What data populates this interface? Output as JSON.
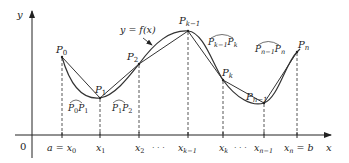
{
  "diagram": {
    "axes": {
      "x_label": "x",
      "y_label": "y",
      "origin_label": "0"
    },
    "curve_label": "y = f(x)",
    "colors": {
      "curve": "#333333",
      "axis": "#222222",
      "dashed": "#444444",
      "text": "#222222"
    },
    "points": [
      {
        "id": "P0",
        "label": "P",
        "sub": "0",
        "x": 62,
        "y": 57
      },
      {
        "id": "P1",
        "label": "P",
        "sub": "1",
        "x": 100,
        "y": 98
      },
      {
        "id": "P2",
        "label": "P",
        "sub": "2",
        "x": 139,
        "y": 64
      },
      {
        "id": "Pk-1",
        "label": "P",
        "sub": "k−1",
        "x": 188,
        "y": 31
      },
      {
        "id": "Pk",
        "label": "P",
        "sub": "k",
        "x": 223,
        "y": 80
      },
      {
        "id": "Pn-1",
        "label": "P",
        "sub": "n−1",
        "x": 264,
        "y": 103
      },
      {
        "id": "Pn",
        "label": "P",
        "sub": "n",
        "x": 297,
        "y": 52
      }
    ],
    "x_ticks": [
      {
        "label": "a = x",
        "sub": "0",
        "x": 62
      },
      {
        "label": "x",
        "sub": "1",
        "x": 100
      },
      {
        "label": "x",
        "sub": "2",
        "x": 139
      },
      {
        "label": "x",
        "sub": "k−1",
        "x": 188
      },
      {
        "label": "x",
        "sub": "k",
        "x": 223
      },
      {
        "label": "x",
        "sub": "n−1",
        "x": 264
      },
      {
        "label": "x",
        "sub": "n",
        "suffix": " = b",
        "x": 297
      }
    ],
    "ellipsis": "· · ·",
    "arc_labels": [
      {
        "from": "P",
        "from_sub": "0",
        "to": "P",
        "to_sub": "1"
      },
      {
        "from": "P",
        "from_sub": "1",
        "to": "P",
        "to_sub": "2"
      },
      {
        "from": "P",
        "from_sub": "k−1",
        "to": "P",
        "to_sub": "k"
      },
      {
        "from": "P",
        "from_sub": "n−1",
        "to": "P",
        "to_sub": "n"
      }
    ]
  }
}
